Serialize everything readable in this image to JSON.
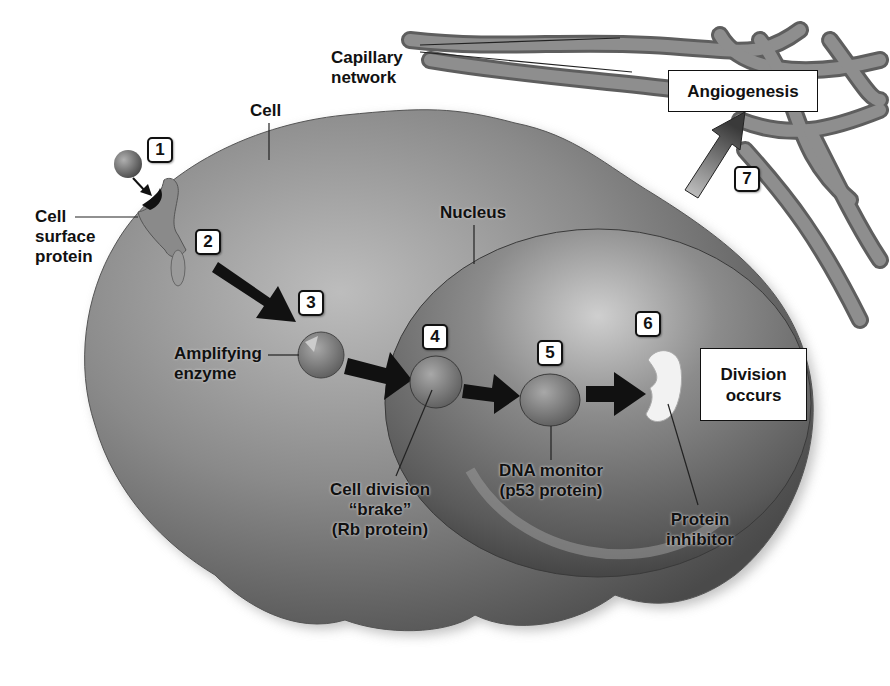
{
  "diagram": {
    "colors": {
      "background": "#ffffff",
      "cell_fill": "#7a7a7a",
      "nucleus_fill": "#6a6a6a",
      "arrow": "#111111",
      "vessel": "#808080",
      "label_box_border": "#111111"
    },
    "labels": {
      "capillary": "Capillary\nnetwork",
      "cell": "Cell",
      "cell_surface_protein": "Cell\nsurface\nprotein",
      "nucleus": "Nucleus",
      "amplifying_enzyme": "Amplifying\nenzyme",
      "rb_protein": "Cell division\n“brake”\n(Rb protein)",
      "p53": "DNA monitor\n(p53 protein)",
      "protein_inhibitor": "Protein\ninhibitor",
      "angiogenesis": "Angiogenesis",
      "division_occurs": "Division\noccurs"
    },
    "steps": [
      "1",
      "2",
      "3",
      "4",
      "5",
      "6",
      "7"
    ]
  }
}
